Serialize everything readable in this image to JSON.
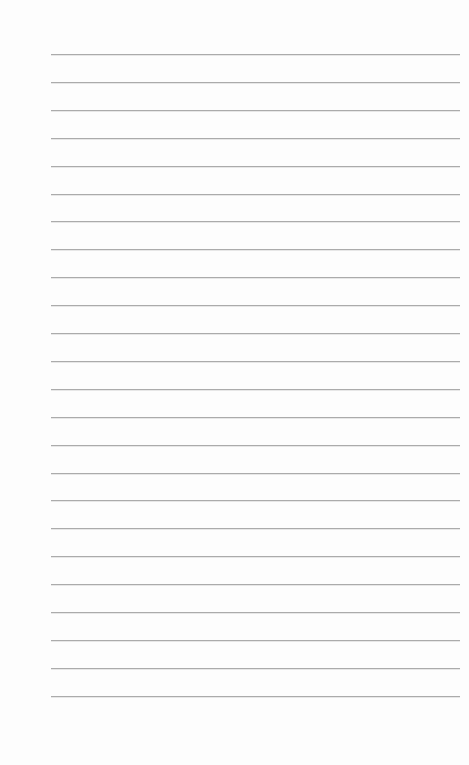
{
  "page": {
    "type": "lined-paper",
    "background_color": "#fdfdfd",
    "line_color": "#ababab",
    "line_count": 24,
    "line_left": 51,
    "line_right": 460,
    "first_line_y": 54,
    "line_spacing": 27.9
  }
}
